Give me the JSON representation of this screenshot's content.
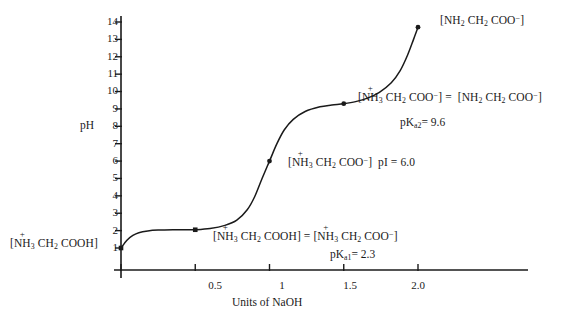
{
  "chart_data": {
    "type": "line",
    "title": "",
    "xlabel": "Units of NaOH",
    "ylabel": "pH",
    "xlim": [
      0,
      2.25
    ],
    "ylim": [
      0,
      14.6
    ],
    "grid": false,
    "legend": null,
    "x_ticks": [
      {
        "value": 0.5,
        "label": "0.5"
      },
      {
        "value": 1.0,
        "label": "1"
      },
      {
        "value": 1.5,
        "label": "1.5"
      },
      {
        "value": 2.0,
        "label": "2.0"
      }
    ],
    "y_ticks": [
      {
        "value": 1,
        "label": "1"
      },
      {
        "value": 2,
        "label": "2"
      },
      {
        "value": 3,
        "label": "3"
      },
      {
        "value": 4,
        "label": "4"
      },
      {
        "value": 5,
        "label": "5"
      },
      {
        "value": 6,
        "label": "6"
      },
      {
        "value": 7,
        "label": "7"
      },
      {
        "value": 8,
        "label": "8"
      },
      {
        "value": 9,
        "label": "9"
      },
      {
        "value": 10,
        "label": "10"
      },
      {
        "value": 11,
        "label": "11"
      },
      {
        "value": 12,
        "label": "12"
      },
      {
        "value": 13,
        "label": "13"
      },
      {
        "value": 14,
        "label": "14"
      }
    ],
    "series": [
      {
        "name": "glycine titration",
        "x": [
          0.0,
          0.04,
          0.08,
          0.12,
          0.18,
          0.25,
          0.35,
          0.45,
          0.5,
          0.6,
          0.7,
          0.78,
          0.85,
          0.9,
          0.95,
          1.0,
          1.05,
          1.1,
          1.16,
          1.24,
          1.34,
          1.42,
          1.5,
          1.58,
          1.66,
          1.74,
          1.82,
          1.88,
          1.93,
          1.97,
          2.0
        ],
        "y": [
          1.0,
          1.45,
          1.72,
          1.88,
          1.98,
          2.03,
          2.05,
          2.05,
          2.05,
          2.12,
          2.3,
          2.6,
          3.2,
          3.95,
          5.0,
          6.0,
          7.0,
          7.8,
          8.4,
          8.85,
          9.12,
          9.22,
          9.3,
          9.42,
          9.62,
          9.95,
          10.5,
          11.2,
          12.1,
          13.0,
          13.7
        ]
      }
    ],
    "markers": [
      {
        "x": 0.0,
        "y": 1.0,
        "shape": "square"
      },
      {
        "x": 0.5,
        "y": 2.05,
        "shape": "square"
      },
      {
        "x": 1.0,
        "y": 6.0,
        "shape": "circle"
      },
      {
        "x": 1.5,
        "y": 9.3,
        "shape": "circle"
      },
      {
        "x": 2.0,
        "y": 13.7,
        "shape": "circle"
      }
    ],
    "annotations": [
      {
        "id": "start-species",
        "at": [
          0.0,
          1.0
        ],
        "text": "[+NH3 CH2 COOH]"
      },
      {
        "id": "pka1-equality",
        "at": [
          0.5,
          2.05
        ],
        "text": "[+NH3 CH2 COOH] = [+NH3 CH2 COO-]"
      },
      {
        "id": "pka1-value",
        "at": [
          0.5,
          2.05
        ],
        "text": "pKa1 = 2.3"
      },
      {
        "id": "pi-species",
        "at": [
          1.0,
          6.0
        ],
        "text": "[+NH3 CH2 COO-]  pI = 6.0"
      },
      {
        "id": "pka2-equality",
        "at": [
          1.5,
          9.3
        ],
        "text": "[+NH3 CH2 COO-] = [NH2 CH2 COO-]"
      },
      {
        "id": "pka2-value",
        "at": [
          1.5,
          9.3
        ],
        "text": "pKa2 = 9.6"
      },
      {
        "id": "end-species",
        "at": [
          2.0,
          13.7
        ],
        "text": "[NH2 CH2 COO-]"
      }
    ]
  },
  "axes": {
    "y_label": "pH",
    "x_label": "Units of NaOH",
    "x_tick_labels": [
      "0.5",
      "1",
      "1.5",
      "2.0"
    ],
    "y_tick_labels": [
      "14",
      "13",
      "12",
      "11",
      "10",
      "9",
      "8",
      "7",
      "6",
      "5",
      "4",
      "3",
      "2",
      "1"
    ]
  },
  "annotations": {
    "start_species": {
      "bracket_open": "[",
      "charge": "+",
      "n": "NH",
      "n_sub": "3",
      "c": "CH",
      "c_sub": "2",
      "tail": "COOH",
      "bracket_close": "]"
    },
    "pka1": {
      "left_bracket_open": "[",
      "left_charge": "+",
      "left_n": "NH",
      "left_n_sub": "3",
      "left_c": "CH",
      "left_c_sub": "2",
      "left_tail": "COOH",
      "left_bracket_close": "]",
      "equals": "=",
      "right_bracket_open": "[",
      "right_charge": "+",
      "right_n": "NH",
      "right_n_sub": "3",
      "right_c": "CH",
      "right_c_sub": "2",
      "right_tail": "COO",
      "right_tail_sup": "−",
      "right_bracket_close": "]",
      "pk_text": "pK",
      "pk_sub": "a1",
      "pk_value": "= 2.3"
    },
    "pi": {
      "bracket_open": "[",
      "charge": "+",
      "n": "NH",
      "n_sub": "3",
      "c": "CH",
      "c_sub": "2",
      "tail": "COO",
      "tail_sup": "−",
      "bracket_close": "]",
      "pi_text": "pI = 6.0"
    },
    "pka2": {
      "left_bracket_open": "[",
      "left_charge": "+",
      "left_n": "NH",
      "left_n_sub": "3",
      "left_c": "CH",
      "left_c_sub": "2",
      "left_tail": "COO",
      "left_tail_sup": "−",
      "left_bracket_close": "]",
      "equals": "=",
      "right_bracket_open": "[",
      "right_n": "NH",
      "right_n_sub": "2",
      "right_c": "CH",
      "right_c_sub": "2",
      "right_tail": "COO",
      "right_tail_sup": "−",
      "right_bracket_close": "]",
      "pk_text": "pK",
      "pk_sub": "a2",
      "pk_value": "= 9.6"
    },
    "end_species": {
      "bracket_open": "[",
      "n": "NH",
      "n_sub": "2",
      "c": "CH",
      "c_sub": "2",
      "tail": "COO",
      "tail_sup": "−",
      "bracket_close": "]"
    }
  },
  "style": {
    "curve_color": "#1a1a1a",
    "axis_color": "#1a1a1a",
    "text_color": "#1a1a1a",
    "background": "#ffffff"
  }
}
